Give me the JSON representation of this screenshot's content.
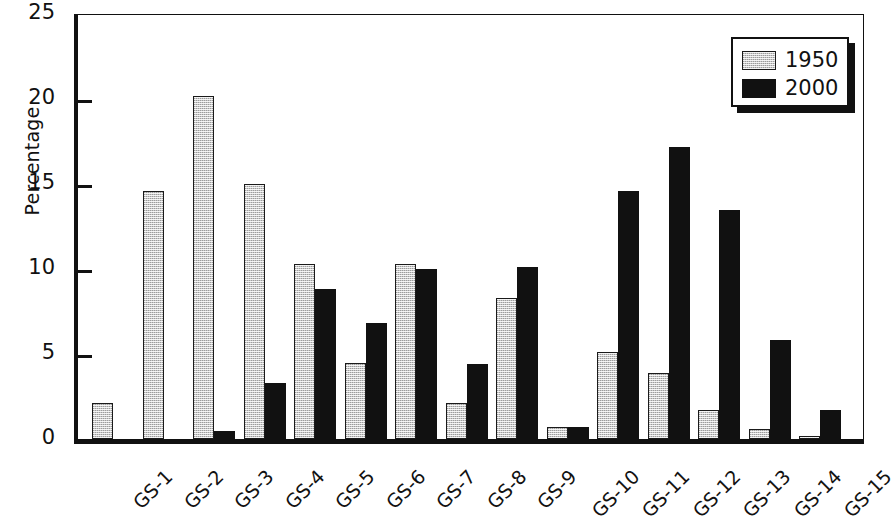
{
  "chart_data": {
    "type": "bar",
    "title": "",
    "xlabel": "",
    "ylabel": "Percentage",
    "ylim": [
      0,
      25
    ],
    "yticks": [
      0,
      5,
      10,
      15,
      20,
      25
    ],
    "grid": false,
    "legend_position": "top-right",
    "categories": [
      "GS-1",
      "GS-2",
      "GS-3",
      "GS-4",
      "GS-5",
      "GS-6",
      "GS-7",
      "GS-8",
      "GS-9",
      "GS-10",
      "GS-11",
      "GS-12",
      "GS-13",
      "GS-14",
      "GS-15"
    ],
    "series": [
      {
        "name": "1950",
        "color": "#c9c9c9",
        "values": [
          2.1,
          14.6,
          20.2,
          15.0,
          10.3,
          4.5,
          10.3,
          2.1,
          8.3,
          0.7,
          5.1,
          3.9,
          1.7,
          0.6,
          0.2
        ]
      },
      {
        "name": "2000",
        "color": "#111111",
        "values": [
          0,
          0,
          0.5,
          3.3,
          8.8,
          6.8,
          10.0,
          4.4,
          10.1,
          0.7,
          14.6,
          17.2,
          13.5,
          5.8,
          1.7
        ]
      }
    ]
  },
  "axis": {
    "y_title": "Percentage",
    "y_tick_labels": [
      "0",
      "5",
      "10",
      "15",
      "20",
      "25"
    ]
  },
  "legend": {
    "entries": [
      {
        "label": "1950",
        "swatch": "light-gray-hatch"
      },
      {
        "label": "2000",
        "swatch": "solid-black"
      }
    ]
  }
}
